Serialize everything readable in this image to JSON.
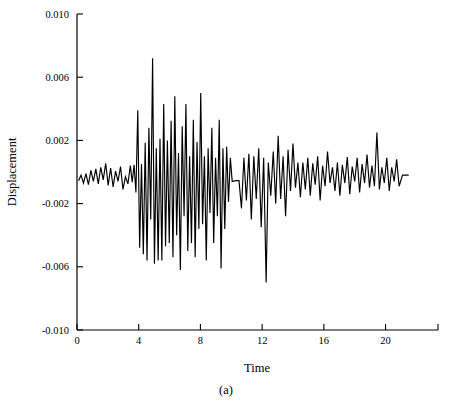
{
  "chart_data": {
    "type": "line",
    "title": "",
    "xlabel": "Time",
    "ylabel": "Displacement",
    "caption": "(a)",
    "xlim": [
      0,
      23.4
    ],
    "ylim": [
      -0.01,
      0.01
    ],
    "xticks": [
      0,
      4,
      8,
      12,
      16,
      20
    ],
    "xticklabels": [
      "0",
      "4",
      "8",
      "12",
      "16",
      "20"
    ],
    "yticks": [
      0.01,
      0.006,
      0.002,
      -0.002,
      -0.006,
      -0.01
    ],
    "yticklabels": [
      "0.010",
      "0.006",
      "0.002",
      "-0.002",
      "-0.006",
      "-0.010"
    ],
    "grid": false,
    "legend": null,
    "line_color": "#000000",
    "background_color": "#ffffff",
    "series": [
      {
        "name": "Displacement",
        "x": [
          0.1,
          0.26,
          0.42,
          0.58,
          0.74,
          0.9,
          1.06,
          1.22,
          1.38,
          1.54,
          1.7,
          1.86,
          2.02,
          2.18,
          2.34,
          2.5,
          2.66,
          2.82,
          2.98,
          3.14,
          3.3,
          3.46,
          3.58,
          3.7,
          3.82,
          3.94,
          4.06,
          4.18,
          4.3,
          4.42,
          4.54,
          4.66,
          4.78,
          4.9,
          5.02,
          5.14,
          5.26,
          5.38,
          5.5,
          5.62,
          5.74,
          5.86,
          5.98,
          6.1,
          6.22,
          6.34,
          6.46,
          6.58,
          6.7,
          6.82,
          6.94,
          7.06,
          7.18,
          7.3,
          7.42,
          7.54,
          7.66,
          7.78,
          7.9,
          8.02,
          8.14,
          8.26,
          8.38,
          8.5,
          8.62,
          8.74,
          8.86,
          8.98,
          9.1,
          9.22,
          9.34,
          9.46,
          9.58,
          9.7,
          9.82,
          9.94,
          10.06,
          10.3,
          10.5,
          10.66,
          10.82,
          10.98,
          11.14,
          11.3,
          11.46,
          11.62,
          11.78,
          11.94,
          12.1,
          12.26,
          12.4,
          12.56,
          12.72,
          12.88,
          13.04,
          13.2,
          13.36,
          13.52,
          13.68,
          13.84,
          14.0,
          14.16,
          14.32,
          14.48,
          14.64,
          14.8,
          14.96,
          15.12,
          15.28,
          15.44,
          15.6,
          15.76,
          15.92,
          16.08,
          16.24,
          16.4,
          16.56,
          16.72,
          16.88,
          17.04,
          17.2,
          17.36,
          17.52,
          17.68,
          17.84,
          18.0,
          18.16,
          18.32,
          18.48,
          18.64,
          18.8,
          18.96,
          19.12,
          19.28,
          19.44,
          19.6,
          19.76,
          19.92,
          20.08,
          20.24,
          20.4,
          20.56,
          20.72,
          20.88,
          21.1,
          21.5
        ],
        "y": [
          -0.00055,
          -0.0002,
          -0.0007,
          -0.0001,
          -0.0008,
          0.0001,
          -0.0006,
          0.0002,
          -0.00075,
          0.0003,
          -0.0005,
          0.00055,
          -0.00085,
          0.00025,
          -0.00095,
          5e-05,
          -0.0006,
          0.00035,
          -0.0011,
          -0.0003,
          -0.00075,
          0.0004,
          -0.00065,
          0.00045,
          -0.0013,
          0.0039,
          -0.0048,
          0.0005,
          -0.0052,
          0.00185,
          -0.0056,
          0.0028,
          -0.003,
          0.0072,
          -0.0058,
          0.0015,
          -0.0056,
          0.0021,
          -0.0056,
          0.0043,
          -0.0047,
          0.002,
          -0.0045,
          0.00325,
          -0.0054,
          0.0048,
          -0.004,
          0.0012,
          -0.0062,
          0.0029,
          -0.0028,
          0.0043,
          -0.005,
          0.001,
          -0.0045,
          0.0033,
          -0.0054,
          0.0019,
          -0.0036,
          0.005,
          -0.0033,
          0.001,
          -0.0056,
          0.0015,
          -0.0026,
          0.0028,
          -0.0045,
          0.0009,
          -0.0028,
          0.0033,
          -0.0061,
          0.0015,
          -0.0036,
          0.0016,
          -0.0019,
          0.0009,
          -0.0006,
          -0.00055,
          -0.00055,
          -0.0023,
          0.0009,
          -0.0018,
          0.00115,
          -0.003,
          0.001,
          -0.0017,
          0.0015,
          -0.0035,
          0.0009,
          -0.007,
          0.0006,
          -0.0015,
          0.0013,
          -0.002,
          0.0023,
          -0.0017,
          0.001,
          -0.0028,
          0.0014,
          -0.0012,
          0.0018,
          -0.001,
          0.0006,
          -0.0016,
          0.0006,
          -0.0011,
          0.0009,
          -0.0015,
          0.00055,
          -0.0008,
          0.001,
          -0.0018,
          0.0004,
          -0.0009,
          0.0013,
          -0.0007,
          0.0003,
          -0.0012,
          0.0006,
          -0.0015,
          0.00045,
          -0.0007,
          0.00095,
          -0.0014,
          0.00035,
          -0.0006,
          0.0009,
          -0.0013,
          0.0005,
          -0.0007,
          0.0011,
          -0.001,
          0.0004,
          -0.0009,
          0.0025,
          -0.0011,
          0.0003,
          -0.0007,
          0.0009,
          -0.0012,
          0.0003,
          -0.0006,
          0.0008,
          -0.0009,
          -0.0002,
          -0.0002
        ]
      }
    ]
  },
  "geometry": {
    "plot_left": 77,
    "plot_right": 438,
    "plot_top": 14,
    "plot_bottom": 330
  }
}
